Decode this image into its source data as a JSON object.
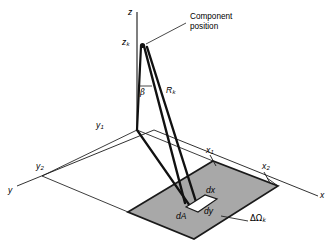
{
  "colors": {
    "background": "#ffffff",
    "line": "#1a1a1a",
    "patch_fill": "#a8a8a8",
    "patch_edge": "#1a1a1a",
    "element_fill": "#ffffff",
    "thin_line": "#2b2b2b",
    "axis_line": "#333333",
    "leader": "#1a1a1a"
  },
  "labels": {
    "z_axis": "z",
    "x_axis": "x",
    "y_axis": "y",
    "component_height": "z",
    "component_height_sub": "k",
    "slant_range": "R",
    "slant_range_sub": "k",
    "angle": "β",
    "y1": "y",
    "y1_sub": "1",
    "y2": "y",
    "y2_sub": "2",
    "x1": "x",
    "x1_sub": "1",
    "x2": "x",
    "x2_sub": "2",
    "dx": "dx",
    "dy": "dy",
    "dA": "dA",
    "solid_angle": "ΔΩ",
    "solid_angle_sub": "k",
    "callout_line1": "Component",
    "callout_line2": "position"
  }
}
